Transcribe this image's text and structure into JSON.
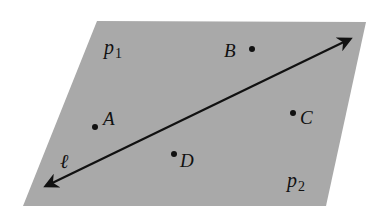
{
  "diagram": {
    "colors": {
      "background": "#ffffff",
      "plane_fill": "#a9a9a9",
      "ink": "#111111"
    },
    "plane": {
      "points": "97,21 366,22 326,206 23,206"
    },
    "region_labels": [
      {
        "name": "p1",
        "letter": "p",
        "sub": "1",
        "x": 104,
        "y": 54
      },
      {
        "name": "p2",
        "letter": "p",
        "sub": "2",
        "x": 287,
        "y": 187
      }
    ],
    "line": {
      "label": "ℓ",
      "x1": 46,
      "y1": 186,
      "x2": 350,
      "y2": 39,
      "label_x": 60,
      "label_y": 168
    },
    "points": [
      {
        "name": "A",
        "label": "A",
        "cx": 95,
        "cy": 127,
        "lx": 103,
        "ly": 125
      },
      {
        "name": "B",
        "label": "B",
        "cx": 252,
        "cy": 49,
        "lx": 224,
        "ly": 57
      },
      {
        "name": "C",
        "label": "C",
        "cx": 293,
        "cy": 113,
        "lx": 300,
        "ly": 124
      },
      {
        "name": "D",
        "label": "D",
        "cx": 174,
        "cy": 154,
        "lx": 180,
        "ly": 167
      }
    ]
  }
}
